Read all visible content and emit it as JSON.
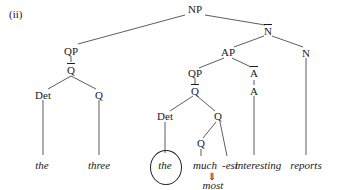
{
  "label": "(ii)",
  "nodes": {
    "np": "NP",
    "qp_left": "QP",
    "qbar_left": "Q",
    "det_left": "Det",
    "q_left": "Q",
    "nbar": "N",
    "ap": "AP",
    "n_right": "N",
    "qp_mid": "QP",
    "qbar_mid": "Q",
    "abar": "A",
    "a": "A",
    "det_mid": "Det",
    "q_mid": "Q",
    "q_inner": "Q"
  },
  "leaves": {
    "the1": "the",
    "three": "three",
    "the2": "the",
    "much": "much",
    "est": "-est",
    "interesting": "interesting",
    "reports": "reports",
    "arrow": "⇓",
    "most": "most"
  }
}
